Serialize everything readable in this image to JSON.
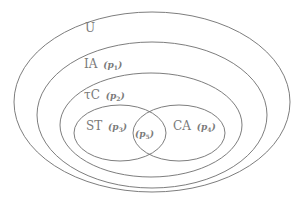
{
  "diagram": {
    "type": "venn",
    "stroke_color": "#6e6e6e",
    "text_color": "#7a7a7a",
    "sets": [
      {
        "id": "U",
        "label": "U",
        "param": "",
        "param_sub": ""
      },
      {
        "id": "IA",
        "label": "IA",
        "param": "(p",
        "param_sub": "1",
        "close": ")"
      },
      {
        "id": "tauC",
        "label": "τC",
        "param": "(p",
        "param_sub": "2",
        "close": ")"
      },
      {
        "id": "ST",
        "label": "ST",
        "param": "(p",
        "param_sub": "3",
        "close": ")"
      },
      {
        "id": "CA",
        "label": "CA",
        "param": "(p",
        "param_sub": "4",
        "close": ")"
      },
      {
        "id": "ST_CA",
        "label": "",
        "param": "(p",
        "param_sub": "5",
        "close": ")"
      }
    ],
    "relations": [
      "IA ⊂ U",
      "τC ⊂ IA",
      "ST ⊂ τC",
      "CA ⊂ τC",
      "p5 = ST ∩ CA"
    ]
  }
}
